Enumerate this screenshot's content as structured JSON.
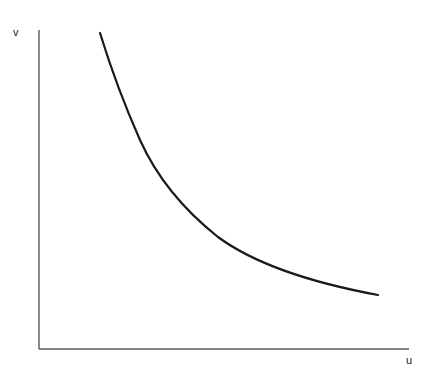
{
  "figure": {
    "background_color": "#ffffff",
    "width": 430,
    "height": 372
  },
  "axes": {
    "y_axis": {
      "label": "v",
      "color": "#5a5a5a",
      "x": 39,
      "y_top": 30,
      "y_bottom": 349,
      "stroke_width": 1.4
    },
    "x_axis": {
      "label": "u",
      "color": "#5a5a5a",
      "y": 349,
      "x_left": 39,
      "x_right": 409,
      "stroke_width": 1.4
    }
  },
  "chart_data": {
    "type": "line",
    "title": "",
    "xlabel": "u",
    "ylabel": "v",
    "grid": false,
    "legend": null,
    "axis_ticks": {
      "x": [],
      "y": []
    },
    "xlim": [
      0,
      1
    ],
    "ylim": [
      0,
      1
    ],
    "series": [
      {
        "name": "v(u)",
        "color": "#1a1a1a",
        "stroke_width": 2.2,
        "description": "monotonically decreasing convex curve, steep at left, flattening toward the right",
        "points_px": [
          [
            100,
            33
          ],
          [
            110,
            58
          ],
          [
            119,
            82
          ],
          [
            130,
            110
          ],
          [
            145,
            148
          ],
          [
            160,
            176
          ],
          [
            178,
            200
          ],
          [
            200,
            222
          ],
          [
            222,
            239
          ],
          [
            245,
            252
          ],
          [
            270,
            263
          ],
          [
            295,
            272
          ],
          [
            320,
            280
          ],
          [
            345,
            287
          ],
          [
            378,
            295
          ]
        ],
        "path_d": "M 100 33 C 112 72, 124 104, 140 140 C 158 180, 184 210, 218 237 C 252 262, 308 282, 378 295"
      }
    ]
  }
}
